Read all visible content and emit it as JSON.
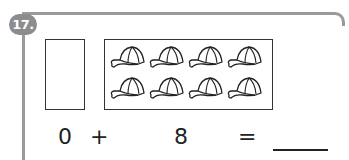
{
  "problem": {
    "number": "17.",
    "equation": {
      "left": "0",
      "operator": "+",
      "right": "8",
      "equals": "=",
      "answer": ""
    },
    "picture": {
      "left_box_count": 0,
      "right_box_count": 8,
      "object_icon": "baseball-cap-icon"
    }
  }
}
